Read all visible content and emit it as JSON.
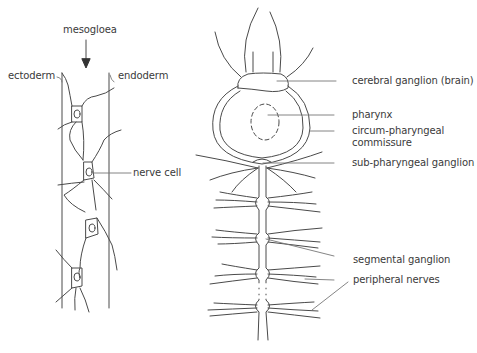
{
  "figure": {
    "left_panel": {
      "title": "Hydra nerve net",
      "labels": {
        "mesogloea": "mesogloea",
        "ectoderm": "ectoderm",
        "endoderm": "endoderm",
        "nerve_cell": "nerve cell"
      }
    },
    "right_panel": {
      "title": "Earthworm nervous system",
      "labels": {
        "cerebral_ganglion": "cerebral ganglion (brain)",
        "pharynx": "pharynx",
        "circum_line1": "circum-pharyngeal",
        "circum_line2": "commissure",
        "sub_pharyngeal": "sub-pharyngeal ganglion",
        "segmental_ganglion": "segmental ganglion",
        "peripheral_nerves": "peripheral nerves"
      }
    },
    "colors": {
      "line": "#4a4a4a",
      "text": "#3a3a3a",
      "background": "#ffffff"
    }
  }
}
